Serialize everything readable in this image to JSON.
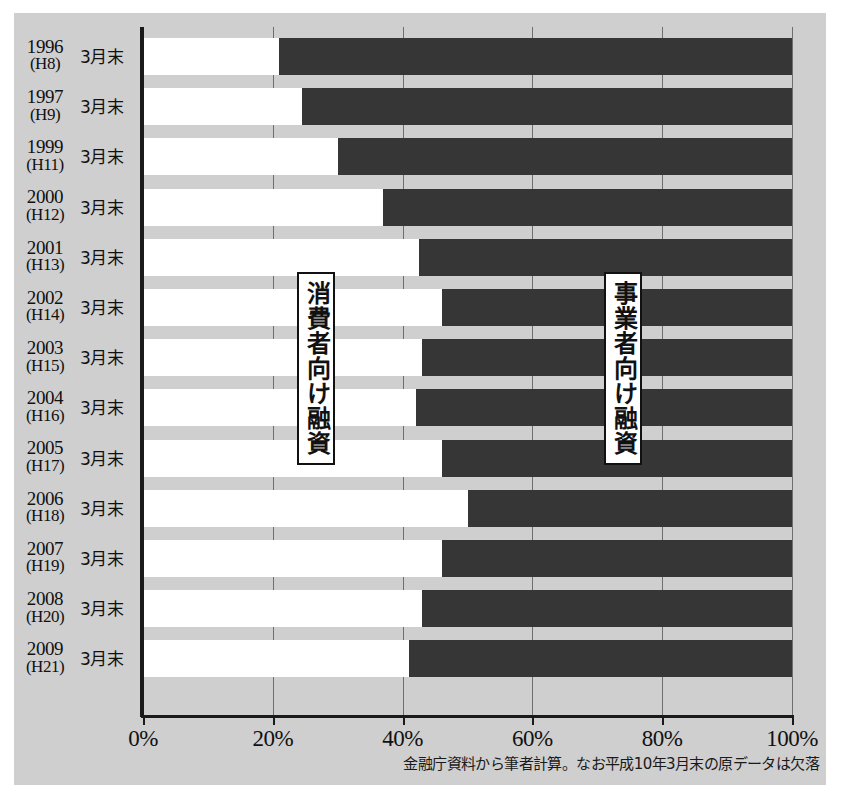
{
  "chart_data": {
    "type": "bar",
    "orientation": "horizontal",
    "stacked": true,
    "normalized": true,
    "title": "",
    "xlabel": "",
    "ylabel": "",
    "xlim": [
      0,
      100
    ],
    "grid": true,
    "legend_position": "inside-plot",
    "xticks": [
      "0%",
      "20%",
      "40%",
      "60%",
      "80%",
      "100%"
    ],
    "xtick_values": [
      0,
      20,
      40,
      60,
      80,
      100
    ],
    "categories": [
      "1996 (H8) 3月末",
      "1997 (H9) 3月末",
      "1999 (H11) 3月末",
      "2000 (H12) 3月末",
      "2001 (H13) 3月末",
      "2002 (H14) 3月末",
      "2003 (H15) 3月末",
      "2004 (H16) 3月末",
      "2005 (H17) 3月末",
      "2006 (H18) 3月末",
      "2007 (H19) 3月末",
      "2008 (H20) 3月末",
      "2009 (H21) 3月末"
    ],
    "series": [
      {
        "name": "消費者向け融資",
        "color": "#ffffff",
        "values": [
          21,
          24.5,
          30,
          37,
          42.5,
          46,
          43,
          42,
          46,
          50,
          46,
          43,
          41
        ]
      },
      {
        "name": "事業者向け融資",
        "color": "#363636",
        "values": [
          79,
          75.5,
          70,
          63,
          57.5,
          54,
          57,
          58,
          54,
          50,
          54,
          57,
          59
        ]
      }
    ],
    "annotations": [
      {
        "text": "消費者向け融資",
        "position": "left-segment"
      },
      {
        "text": "事業者向け融資",
        "position": "right-segment"
      }
    ],
    "footnote": "金融庁資料から筆者計算。なお平成10年3月末の原データは欠落"
  },
  "rows": [
    {
      "year": "1996",
      "era": "(H8)",
      "month": "3月末",
      "light": 21,
      "dark": 79
    },
    {
      "year": "1997",
      "era": "(H9)",
      "month": "3月末",
      "light": 24.5,
      "dark": 75.5
    },
    {
      "year": "1999",
      "era": "(H11)",
      "month": "3月末",
      "light": 30,
      "dark": 70
    },
    {
      "year": "2000",
      "era": "(H12)",
      "month": "3月末",
      "light": 37,
      "dark": 63
    },
    {
      "year": "2001",
      "era": "(H13)",
      "month": "3月末",
      "light": 42.5,
      "dark": 57.5
    },
    {
      "year": "2002",
      "era": "(H14)",
      "month": "3月末",
      "light": 46,
      "dark": 54
    },
    {
      "year": "2003",
      "era": "(H15)",
      "month": "3月末",
      "light": 43,
      "dark": 57
    },
    {
      "year": "2004",
      "era": "(H16)",
      "month": "3月末",
      "light": 42,
      "dark": 58
    },
    {
      "year": "2005",
      "era": "(H17)",
      "month": "3月末",
      "light": 46,
      "dark": 54
    },
    {
      "year": "2006",
      "era": "(H18)",
      "month": "3月末",
      "light": 50,
      "dark": 50
    },
    {
      "year": "2007",
      "era": "(H19)",
      "month": "3月末",
      "light": 46,
      "dark": 54
    },
    {
      "year": "2008",
      "era": "(H20)",
      "month": "3月末",
      "light": 43,
      "dark": 57
    },
    {
      "year": "2009",
      "era": "(H21)",
      "month": "3月末",
      "light": 41,
      "dark": 59
    }
  ],
  "axis": {
    "ticks": [
      "0%",
      "20%",
      "40%",
      "60%",
      "80%",
      "100%"
    ]
  },
  "legend": {
    "left_label": "消費者向け融資",
    "right_label": "事業者向け融資"
  },
  "footnote": "金融庁資料から筆者計算。なお平成10年3月末の原データは欠落",
  "colors": {
    "panel_background": "#cfcfcf",
    "light_segment": "#ffffff",
    "dark_segment": "#363636",
    "axis": "#1a1a1a",
    "gridline": "#6e6e6e"
  }
}
